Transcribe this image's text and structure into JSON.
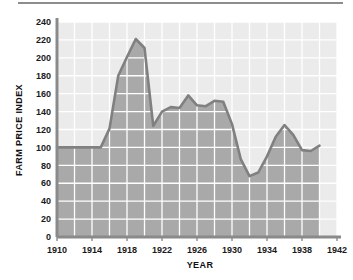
{
  "chart_data": {
    "type": "line",
    "title": "",
    "subtitle": "",
    "xlabel": "YEAR",
    "ylabel": "FARM PRICE INDEX",
    "xlim": [
      1910,
      1942
    ],
    "ylim": [
      0,
      240
    ],
    "x_tick_labels": [
      "1910",
      "1914",
      "1918",
      "1922",
      "1926",
      "1930",
      "1934",
      "1938",
      "1942"
    ],
    "x_ticks": [
      1910,
      1914,
      1918,
      1922,
      1926,
      1930,
      1934,
      1938,
      1942
    ],
    "x_gridline_step": 2,
    "y_tick_labels": [
      "0",
      "20",
      "40",
      "60",
      "80",
      "100",
      "120",
      "140",
      "160",
      "180",
      "200",
      "220",
      "240"
    ],
    "y_ticks": [
      0,
      20,
      40,
      60,
      80,
      100,
      120,
      140,
      160,
      180,
      200,
      220,
      240
    ],
    "grid": true,
    "grid_color": "#ffffff",
    "legend": null,
    "legend_position": "none",
    "fill_below": true,
    "fill_color": "#a9a9a9",
    "plot_background": "#ebebeb",
    "line_color": "#808080",
    "line_width": 2.6,
    "axis_color": "#8a8a8a",
    "x": [
      1910,
      1911,
      1912,
      1913,
      1914,
      1915,
      1916,
      1917,
      1918,
      1919,
      1920,
      1921,
      1922,
      1923,
      1924,
      1925,
      1926,
      1927,
      1928,
      1929,
      1930,
      1931,
      1932,
      1933,
      1934,
      1935,
      1936,
      1937,
      1938,
      1939,
      1940
    ],
    "values": [
      100,
      100,
      100,
      100,
      100,
      100,
      121,
      180,
      201,
      221,
      211,
      124,
      140,
      145,
      144,
      158,
      147,
      146,
      152,
      151,
      126,
      87,
      68,
      72,
      90,
      112,
      125,
      114,
      97,
      96,
      102
    ],
    "series": [
      {
        "name": "Farm Price Index",
        "values": [
          100,
          100,
          100,
          100,
          100,
          100,
          121,
          180,
          201,
          221,
          211,
          124,
          140,
          145,
          144,
          158,
          147,
          146,
          152,
          151,
          126,
          87,
          68,
          72,
          90,
          112,
          125,
          114,
          97,
          96,
          102
        ]
      }
    ],
    "annotations": []
  },
  "axes": {
    "y_axis_title": "FARM PRICE INDEX",
    "x_axis_title": "YEAR"
  }
}
